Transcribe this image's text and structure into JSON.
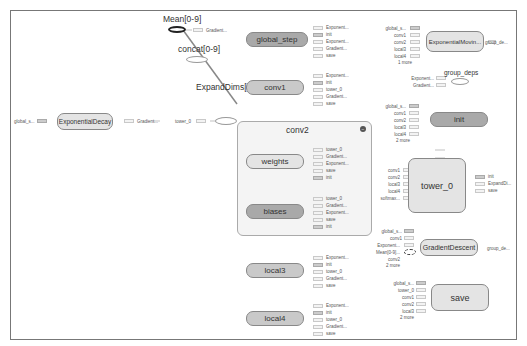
{
  "graph": {
    "standalone": {
      "mean": {
        "label": "Mean[0-9]",
        "out": "Gradient..."
      },
      "concat": {
        "label": "concat[0-9]"
      },
      "expanddims": {
        "label": "ExpandDims[0-9]",
        "in": "tower_0"
      },
      "exp_decay": {
        "label": "ExponentialDecay",
        "in": "global_s...",
        "out": "Gradient..."
      },
      "group_deps": {
        "label": "group_deps",
        "in": [
          "Exponent...",
          "Gradient..."
        ]
      }
    },
    "global_step": {
      "label": "global_step",
      "ports": [
        "Exponent...",
        "init",
        "Exponent...",
        "Gradient...",
        "save"
      ]
    },
    "conv1": {
      "label": "conv1",
      "ports": [
        "Exponent...",
        "init",
        "tower_0",
        "Gradient...",
        "save"
      ]
    },
    "exp_moving": {
      "label": "ExponentialMovin...",
      "in": [
        "global_s...",
        "conv1",
        "conv2",
        "local3",
        "local4",
        "1 more"
      ],
      "out": "group_de..."
    },
    "conv2": {
      "label": "conv2",
      "collapse_icon": "−",
      "weights": {
        "label": "weights",
        "ports": [
          "tower_0",
          "Gradient...",
          "Exponent...",
          "save",
          "init"
        ]
      },
      "biases": {
        "label": "biases",
        "ports": [
          "tower_0",
          "Gradient...",
          "Exponent...",
          "save",
          "init"
        ]
      }
    },
    "init": {
      "label": "init",
      "in": [
        "global_s...",
        "conv1",
        "conv2",
        "local3",
        "local4",
        "2 more"
      ]
    },
    "tower_0": {
      "label": "tower_0",
      "in": [
        "conv1",
        "conv2",
        "local3",
        "local4",
        "softmax..."
      ],
      "out": [
        "init",
        "ExpandDi...",
        "save"
      ]
    },
    "gradient_descent": {
      "label": "GradientDescent",
      "in": [
        "global_s...",
        "conv1",
        "Exponent...",
        "Mean[0-9]...",
        "conv2",
        "2 more"
      ],
      "out": "group_de..."
    },
    "local3": {
      "label": "local3",
      "ports": [
        "Exponent...",
        "init",
        "tower_0",
        "Gradient...",
        "save"
      ]
    },
    "local4": {
      "label": "local4",
      "ports": [
        "Exponent...",
        "init",
        "tower_0",
        "Gradient...",
        "save"
      ]
    },
    "save": {
      "label": "save",
      "in": [
        "global_s...",
        "tower_0",
        "conv1",
        "conv2",
        "local3",
        "2 more"
      ]
    }
  },
  "colors": {
    "dark_node": "#a9a9a9",
    "mid_node": "#c9c9c9",
    "light_node": "#e4e4e4",
    "cluster_bg": "#f4f4f4",
    "border": "#777777"
  }
}
